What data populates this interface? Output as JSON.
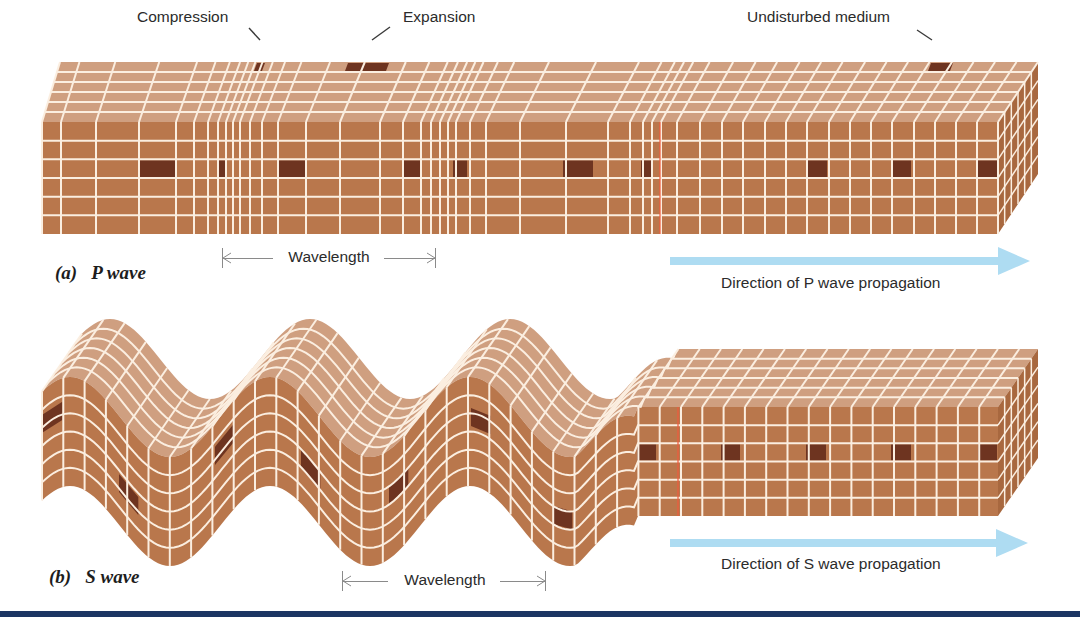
{
  "figure": {
    "callouts": {
      "compression": "Compression",
      "expansion": "Expansion",
      "undisturbed": "Undisturbed medium"
    },
    "p_wave": {
      "label_tag": "(a)",
      "label_name": "P wave",
      "wavelength_label": "Wavelength",
      "direction_label": "Direction of P wave propagation"
    },
    "s_wave": {
      "label_tag": "(b)",
      "label_name": "S wave",
      "wavelength_label": "Wavelength",
      "direction_label": "Direction of S wave propagation"
    }
  },
  "colors": {
    "front_face": "#b9774c",
    "top_face": "#cf9f80",
    "side_face": "#a8683f",
    "grid_line": "#fbeee0",
    "marker_cell": "#6e3420",
    "arrow": "#aedcf2",
    "wave_front_line": "#f05a3c",
    "bottom_bar": "#1c3563"
  },
  "geometry": {
    "p_block": {
      "front_top": 122,
      "front_bottom": 234,
      "rows": 6,
      "depth_dx": 40,
      "depth_dy": -60,
      "depth_rows": 6,
      "columns": [
        42,
        61,
        96,
        139,
        176,
        194,
        208,
        218,
        226,
        233,
        240,
        250,
        262,
        278,
        306,
        340,
        380,
        403,
        421,
        431,
        440,
        448,
        456,
        470,
        486,
        520,
        566,
        608,
        630,
        643,
        652,
        661,
        677,
        700,
        722,
        743,
        765,
        786,
        807,
        829,
        850,
        871,
        892,
        914,
        935,
        956,
        977,
        998
      ],
      "marker_cells": [
        [
          138,
          178
        ],
        [
          218,
          226
        ],
        [
          278,
          306
        ],
        [
          403,
          421
        ],
        [
          452,
          468
        ],
        [
          562,
          594
        ],
        [
          640,
          654
        ],
        [
          805,
          828
        ],
        [
          890,
          912
        ],
        [
          977,
          998
        ]
      ],
      "wave_front_x": 660
    },
    "s_block": {
      "start_x": 42,
      "flat_start_x": 636,
      "end_x": 998,
      "front_top": 407,
      "front_bottom": 516,
      "rows": 6,
      "depth_dx": 40,
      "depth_dy": -58,
      "depth_rows": 6,
      "cell_w": 21.3,
      "amplitude": 40,
      "wavelength": 200,
      "phase_x": 120,
      "marker_cells_wavy": [
        [
          42,
          1.8
        ],
        [
          118,
          3.7
        ],
        [
          214,
          1.8
        ],
        [
          300,
          3.5
        ],
        [
          388,
          2.5
        ],
        [
          470,
          2.2
        ],
        [
          552,
          3.5
        ]
      ],
      "marker_cells_flat": [
        [
          636,
          657
        ],
        [
          720,
          741
        ],
        [
          805,
          827
        ],
        [
          890,
          912
        ],
        [
          977,
          998
        ]
      ],
      "wave_front_x": 678
    },
    "p_wavelength": {
      "x1": 222,
      "x2": 436,
      "y": 248
    },
    "s_wavelength": {
      "x1": 342,
      "x2": 546,
      "y": 571
    },
    "p_arrow": {
      "x1": 670,
      "x2": 1030,
      "y": 261
    },
    "s_arrow": {
      "x1": 670,
      "x2": 1028,
      "y": 543
    }
  }
}
